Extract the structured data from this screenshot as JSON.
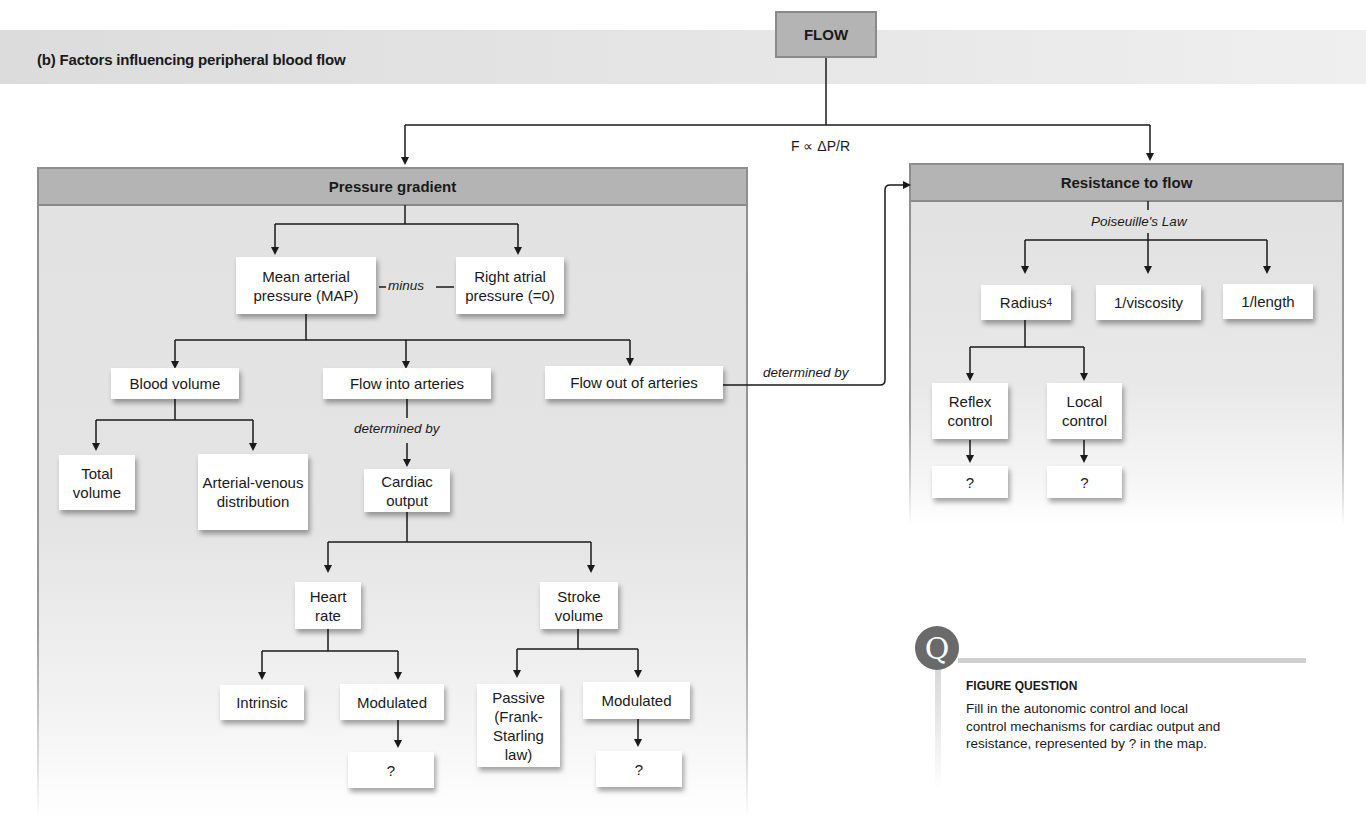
{
  "title": "(b) Factors influencing peripheral blood flow",
  "root": {
    "label": "FLOW",
    "formula": "F ∝ ΔP/R"
  },
  "pressure_panel": {
    "header": "Pressure gradient",
    "map": "Mean arterial pressure (MAP)",
    "minus_label": "minus",
    "right_atrial": "Right atrial pressure (=0)",
    "blood_volume": "Blood volume",
    "flow_into": "Flow into arteries",
    "flow_out": "Flow out of arteries",
    "total_volume": "Total volume",
    "av_distribution": "Arterial-venous distribution",
    "determined_by": "determined by",
    "cardiac_output": "Cardiac output",
    "heart_rate": "Heart rate",
    "stroke_volume": "Stroke volume",
    "intrinsic": "Intrinsic",
    "hr_modulated": "Modulated",
    "hr_unknown": "?",
    "passive": "Passive (Frank-Starling law)",
    "sv_modulated": "Modulated",
    "sv_unknown": "?"
  },
  "connector_label": "determined by",
  "resistance_panel": {
    "header": "Resistance to flow",
    "law_label": "Poiseuille's Law",
    "radius": "Radius",
    "radius_exp": "4",
    "viscosity": "1/viscosity",
    "length": "1/length",
    "reflex": "Reflex control",
    "local": "Local control",
    "reflex_unknown": "?",
    "local_unknown": "?"
  },
  "figure_question": {
    "icon_letter": "Q",
    "title": "FIGURE QUESTION",
    "text": "Fill in the autonomic control and local control mechanisms for cardiac output and resistance, represented by ? in the map."
  }
}
